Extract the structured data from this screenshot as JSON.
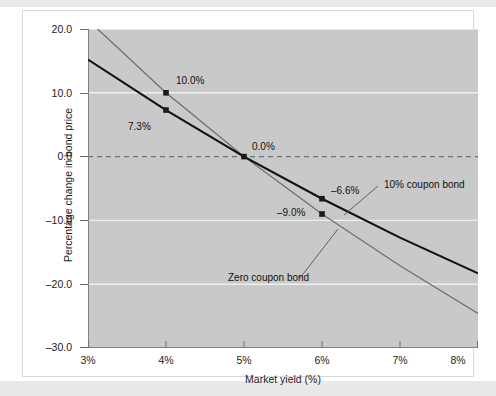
{
  "figure": {
    "background_color": "#ffffff",
    "band_color": "#e9e9e9",
    "plot_background_color": "#c9c9c9",
    "gridline_color": "#efefef",
    "zero_line_color": "#6f6f6f"
  },
  "axes": {
    "x_title": "Market yield (%)",
    "y_title": "Percentage change in bond price",
    "x_ticks": [
      "3%",
      "4%",
      "5%",
      "6%",
      "7%",
      "8%"
    ],
    "y_ticks": [
      "20.0",
      "10.0",
      "0.0",
      "–10.0",
      "–20.0",
      "–30.0"
    ]
  },
  "chart_data": {
    "type": "line",
    "title": "",
    "xlabel": "Market yield (%)",
    "ylabel": "Percentage change in bond price",
    "xlim": [
      3,
      8
    ],
    "ylim": [
      -30,
      20
    ],
    "grid": true,
    "legend": "in-plot annotations",
    "x": [
      3,
      4,
      5,
      6,
      7,
      8
    ],
    "series": [
      {
        "name": "10% coupon bond",
        "color": "#111111",
        "width": 2.1,
        "values": [
          15.2,
          7.3,
          0.0,
          -6.6,
          -12.7,
          -18.3
        ]
      },
      {
        "name": "Zero coupon bond",
        "color": "#6f6f6f",
        "width": 1.3,
        "values": [
          21.4,
          10.0,
          0.0,
          -9.0,
          -17.1,
          -24.6
        ]
      }
    ],
    "markers": [
      {
        "series": "Zero coupon bond",
        "x": 4,
        "y": 10.0,
        "label": "10.0%",
        "label_side": "right"
      },
      {
        "series": "10% coupon bond",
        "x": 4,
        "y": 7.3,
        "label": "7.3%",
        "label_side": "below-left"
      },
      {
        "series": "both",
        "x": 5,
        "y": 0.0,
        "label": "0.0%",
        "label_side": "above-right"
      },
      {
        "series": "10% coupon bond",
        "x": 6,
        "y": -6.6,
        "label": "–6.6%",
        "label_side": "right"
      },
      {
        "series": "Zero coupon bond",
        "x": 6,
        "y": -9.0,
        "label": "–9.0%",
        "label_side": "left"
      }
    ],
    "annotations": [
      {
        "text": "10% coupon bond",
        "leader": "to black curve near 6.6% yield"
      },
      {
        "text": "Zero coupon bond",
        "leader": "to gray curve near 6.6% yield"
      }
    ]
  },
  "labels": {
    "pt_10_0": "10.0%",
    "pt_7_3": "7.3%",
    "pt_0_0": "0.0%",
    "pt_neg_6_6": "–6.6%",
    "pt_neg_9_0": "–9.0%",
    "series_coupon": "10% coupon bond",
    "series_zero": "Zero coupon bond"
  },
  "yticks": {
    "t0": "20.0",
    "t1": "10.0",
    "t2": "0.0",
    "t3": "–10.0",
    "t4": "–20.0",
    "t5": "–30.0"
  },
  "xticks": {
    "t0": "3%",
    "t1": "4%",
    "t2": "5%",
    "t3": "6%",
    "t4": "7%",
    "t5": "8%"
  }
}
